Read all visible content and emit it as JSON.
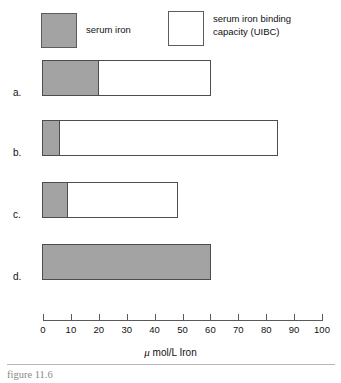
{
  "figure": {
    "caption": "figure 11.6",
    "legend": {
      "iron_label": "serum iron",
      "uibc_label": "serum iron binding\ncapacity (UIBC)"
    }
  },
  "chart_data": {
    "type": "bar",
    "orientation": "horizontal",
    "title": "figure 11.6",
    "xlabel": "μ mol/L Iron",
    "ylabel": "",
    "xlim": [
      0,
      100
    ],
    "xticks": [
      0,
      10,
      20,
      30,
      40,
      50,
      60,
      70,
      80,
      90,
      100
    ],
    "xtick_labels": [
      "0",
      "10",
      "20",
      "30",
      "40",
      "50",
      "60",
      "70",
      "80",
      "90",
      "100"
    ],
    "grid": false,
    "legend_position": "top",
    "stacked": true,
    "categories": [
      "a.",
      "b.",
      "c.",
      "d."
    ],
    "series": [
      {
        "name": "serum iron",
        "color": "#a3a3a3",
        "values": [
          20,
          6,
          9,
          60
        ]
      },
      {
        "name": "serum iron binding capacity (UIBC)",
        "color": "#ffffff",
        "values": [
          40,
          78,
          39,
          0
        ]
      }
    ],
    "totals": [
      60,
      84,
      48,
      60
    ],
    "bars": [
      {
        "label": "a.",
        "serum_iron": 20,
        "uibc": 40,
        "total": 60
      },
      {
        "label": "b.",
        "serum_iron": 6,
        "uibc": 78,
        "total": 84
      },
      {
        "label": "c.",
        "serum_iron": 9,
        "uibc": 39,
        "total": 48
      },
      {
        "label": "d.",
        "serum_iron": 60,
        "uibc": 0,
        "total": 60
      }
    ]
  }
}
